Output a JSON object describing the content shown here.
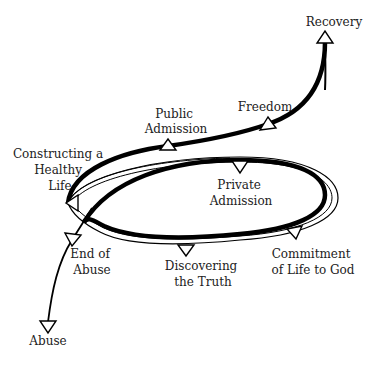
{
  "diagram": {
    "type": "recovery-spiral",
    "colors": {
      "stroke": "#000000",
      "text": "#222222",
      "background": "#ffffff",
      "marker_fill": "#ffffff"
    },
    "stages": [
      {
        "id": "abuse",
        "lines": [
          "Abuse"
        ]
      },
      {
        "id": "end_of_abuse",
        "lines": [
          "End of",
          "Abuse"
        ]
      },
      {
        "id": "discovering_the_truth",
        "lines": [
          "Discovering",
          "the Truth"
        ]
      },
      {
        "id": "commitment_of_life_to_god",
        "lines": [
          "Commitment",
          "of Life to God"
        ]
      },
      {
        "id": "private_admission",
        "lines": [
          "Private",
          "Admission"
        ]
      },
      {
        "id": "constructing_a_healthy_life",
        "lines": [
          "Constructing a",
          "Healthy",
          "Life"
        ]
      },
      {
        "id": "public_admission",
        "lines": [
          "Public",
          "Admission"
        ]
      },
      {
        "id": "freedom",
        "lines": [
          "Freedom"
        ]
      },
      {
        "id": "recovery",
        "lines": [
          "Recovery"
        ]
      }
    ],
    "flow_order": [
      "Abuse",
      "End of Abuse",
      "Discovering the Truth",
      "Commitment of Life to God",
      "Private Admission",
      "Constructing a Healthy Life",
      "Public Admission",
      "Freedom",
      "Recovery"
    ]
  }
}
